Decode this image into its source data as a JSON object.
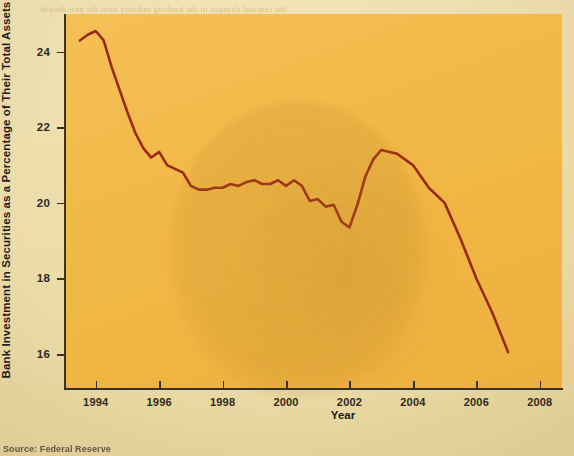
{
  "figure": {
    "source_note": "Source: Federal Reserve",
    "line_color": "#9b2a12",
    "panel_color": "#f1b947",
    "page_color": "#efdfad",
    "axis_color": "#3a3226"
  },
  "ghost_text": [
    "the seminal changes in the banking industry over the past decade",
    "have dramatically reduced the share of assets held in securities",
    "as banks shifted toward higher yielding loan portfolios and the",
    "competition for deposits intensified across the sector through",
    "the period following the recession of the early 2000s",
    "Figure 12.3   Bank securities holdings decline"
  ],
  "chart_data": {
    "type": "line",
    "title": "",
    "xlabel": "Year",
    "ylabel": "Bank Investment in Securities as a Percentage of Their Total Assets",
    "xlim": [
      1993.0,
      2008.7
    ],
    "ylim": [
      15.1,
      25.0
    ],
    "xticks": [
      1994,
      1996,
      1998,
      2000,
      2002,
      2004,
      2006,
      2008
    ],
    "xticklabels": [
      "1994",
      "1996",
      "1998",
      "2000",
      "2002",
      "2004",
      "2006",
      "2008"
    ],
    "yticks": [
      16,
      18,
      20,
      22,
      24
    ],
    "yticklabels": [
      "16",
      "18",
      "20",
      "22",
      "24"
    ],
    "grid": false,
    "legend": false,
    "series": [
      {
        "name": "Bank investment in securities (% of total assets)",
        "x": [
          1993.5,
          1993.75,
          1994.0,
          1994.25,
          1994.5,
          1994.75,
          1995.0,
          1995.25,
          1995.5,
          1995.75,
          1996.0,
          1996.25,
          1996.5,
          1996.75,
          1997.0,
          1997.25,
          1997.5,
          1997.75,
          1998.0,
          1998.25,
          1998.5,
          1998.75,
          1999.0,
          1999.25,
          1999.5,
          1999.75,
          2000.0,
          2000.25,
          2000.5,
          2000.75,
          2001.0,
          2001.25,
          2001.5,
          2001.75,
          2002.0,
          2002.25,
          2002.5,
          2002.75,
          2003.0,
          2003.5,
          2004.0,
          2004.5,
          2005.0,
          2005.5,
          2006.0,
          2006.5,
          2007.0
        ],
        "y": [
          24.3,
          24.45,
          24.55,
          24.3,
          23.6,
          23.0,
          22.4,
          21.85,
          21.45,
          21.2,
          21.35,
          21.0,
          20.9,
          20.8,
          20.45,
          20.35,
          20.35,
          20.4,
          20.4,
          20.5,
          20.45,
          20.55,
          20.6,
          20.5,
          20.5,
          20.6,
          20.45,
          20.6,
          20.45,
          20.05,
          20.1,
          19.9,
          19.95,
          19.5,
          19.35,
          19.95,
          20.7,
          21.15,
          21.4,
          21.3,
          21.0,
          20.4,
          20.0,
          19.05,
          18.0,
          17.1,
          16.05
        ],
        "color": "#9b2a12",
        "linewidth": 2.6
      }
    ]
  }
}
